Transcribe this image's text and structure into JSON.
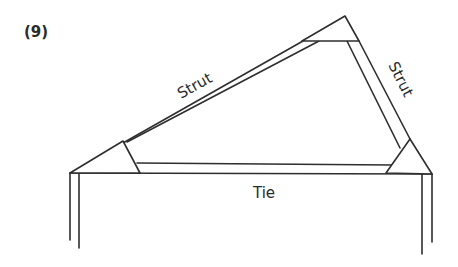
{
  "figure": {
    "number_label": "(9)"
  },
  "members": {
    "left_strut": {
      "label": "Strut"
    },
    "right_strut": {
      "label": "Strut"
    },
    "tie": {
      "label": "Tie"
    }
  },
  "colors": {
    "line": "#2e2e2e",
    "text": "#2a2a2a",
    "background": "#ffffff"
  }
}
